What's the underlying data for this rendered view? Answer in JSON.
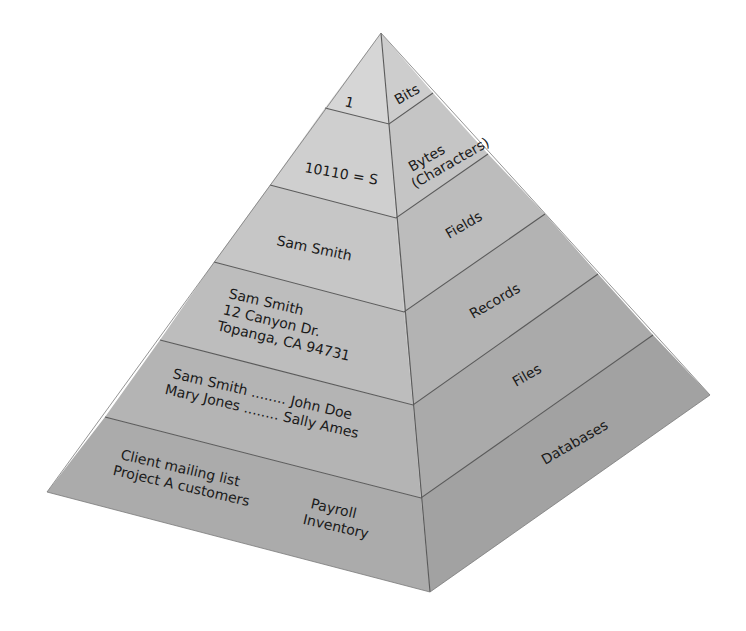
{
  "diagram": {
    "type": "pyramid",
    "colors": {
      "tier_left": [
        "#d6d6d6",
        "#cfcfcf",
        "#c6c6c6",
        "#bdbdbd",
        "#b4b4b4",
        "#ababab"
      ],
      "tier_right": [
        "#cdcdcd",
        "#c5c5c5",
        "#bcbcbc",
        "#b3b3b3",
        "#aaaaaa",
        "#a2a2a2"
      ],
      "line": "#5a5a5a",
      "text": "#1a1a1a"
    },
    "tiers": [
      {
        "level": "Bits",
        "example_lines": [
          "1"
        ]
      },
      {
        "level_lines": [
          "Bytes",
          "(Characters)"
        ],
        "example_lines": [
          "10110 = S"
        ]
      },
      {
        "level": "Fields",
        "example_lines": [
          "Sam Smith"
        ]
      },
      {
        "level": "Records",
        "example_lines": [
          "Sam Smith",
          "12 Canyon Dr.",
          "Topanga, CA 94731"
        ]
      },
      {
        "level": "Files",
        "example_lines": [
          "Sam Smith ........ John Doe",
          "Mary Jones ........ Sally Ames"
        ]
      },
      {
        "level": "Databases",
        "example_lines": [
          "Client mailing list",
          "Project A customers"
        ],
        "example_lines_2": [
          "Payroll",
          "Inventory"
        ]
      }
    ]
  }
}
